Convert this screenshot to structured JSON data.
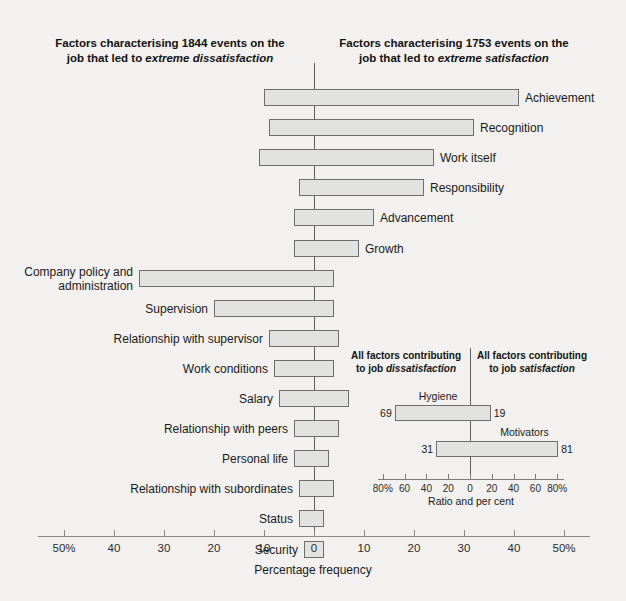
{
  "headings": {
    "left_pre": "Factors characterising 1844 events on the job that led to ",
    "left_em": "extreme dissatisfaction",
    "right_pre": "Factors characterising 1753 events on the job that led to ",
    "right_em": "extreme satisfaction"
  },
  "axis": {
    "title": "Percentage frequency",
    "ticks": [
      "50%",
      "40",
      "30",
      "20",
      "10",
      "0",
      "10",
      "20",
      "30",
      "40",
      "50%"
    ]
  },
  "inset": {
    "head_left_pre": "All factors contributing to job ",
    "head_left_em": "dissatisfaction",
    "head_right_pre": "All factors contributing to job ",
    "head_right_em": "satisfaction",
    "axis_title": "Ratio and per cent",
    "ticks": [
      "80%",
      "60",
      "40",
      "20",
      "0",
      "20",
      "40",
      "60",
      "80%"
    ],
    "rows": [
      {
        "name": "Hygiene",
        "left": 69,
        "right": 19,
        "left_label": "69",
        "right_label": "19"
      },
      {
        "name": "Motivators",
        "left": 31,
        "right": 81,
        "left_label": "31",
        "right_label": "81"
      }
    ]
  },
  "colors": {
    "background": "#f2f1ef",
    "bar_fill": "#e2e2e0",
    "bar_stroke": "#6e6e6e",
    "axis": "#8a8a8a",
    "text": "#1a1a1a"
  },
  "chart_data": {
    "type": "bar",
    "xlabel": "Percentage frequency",
    "ylabel": "",
    "xlim": [
      -50,
      50
    ],
    "grid": false,
    "legend": "none",
    "orientation": "horizontal-diverging",
    "note": "Left of zero = percentage frequency of extreme dissatisfaction; right of zero = extreme satisfaction.",
    "categories": [
      "Achievement",
      "Recognition",
      "Work itself",
      "Responsibility",
      "Advancement",
      "Growth",
      "Company policy and administration",
      "Supervision",
      "Relationship with supervisor",
      "Work conditions",
      "Salary",
      "Relationship with peers",
      "Personal life",
      "Relationship with subordinates",
      "Status",
      "Security"
    ],
    "series": [
      {
        "name": "Dissatisfaction (left)",
        "values": [
          10,
          9,
          11,
          3,
          4,
          4,
          35,
          20,
          9,
          8,
          7,
          4,
          4,
          3,
          3,
          2
        ]
      },
      {
        "name": "Satisfaction (right)",
        "values": [
          41,
          32,
          24,
          22,
          12,
          9,
          4,
          4,
          5,
          4,
          7,
          5,
          3,
          4,
          2,
          2
        ]
      }
    ],
    "label_side": [
      "right",
      "right",
      "right",
      "right",
      "right",
      "right",
      "left",
      "left",
      "left",
      "left",
      "left",
      "left",
      "left",
      "left",
      "left",
      "left"
    ],
    "inset_chart": {
      "type": "bar",
      "xlabel": "Ratio and per cent",
      "xlim": [
        -80,
        80
      ],
      "categories": [
        "Hygiene",
        "Motivators"
      ],
      "series": [
        {
          "name": "Contributing to job dissatisfaction",
          "values": [
            69,
            31
          ]
        },
        {
          "name": "Contributing to job satisfaction",
          "values": [
            19,
            81
          ]
        }
      ]
    }
  }
}
